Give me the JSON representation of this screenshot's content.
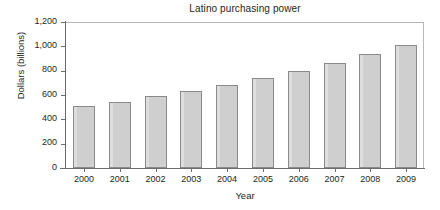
{
  "chart_data": {
    "type": "bar",
    "title": "Latino purchasing power",
    "xlabel": "Year",
    "ylabel": "Dollars (billions)",
    "categories": [
      "2000",
      "2001",
      "2002",
      "2003",
      "2004",
      "2005",
      "2006",
      "2007",
      "2008",
      "2009"
    ],
    "values": [
      510,
      545,
      590,
      635,
      685,
      740,
      795,
      865,
      935,
      1010
    ],
    "ylim": [
      0,
      1200
    ],
    "yticks": [
      0,
      200,
      400,
      600,
      800,
      1000,
      1200
    ],
    "ytick_labels": [
      "0",
      "200",
      "400",
      "600",
      "800",
      "1,000",
      "1,200"
    ],
    "grid": false,
    "legend": null,
    "bar_color": "#cfcfcf",
    "bar_border_color": "#8a8a8a",
    "axis_color": "#6d6d6d",
    "text_color": "#231f20",
    "background": "#ffffff"
  }
}
